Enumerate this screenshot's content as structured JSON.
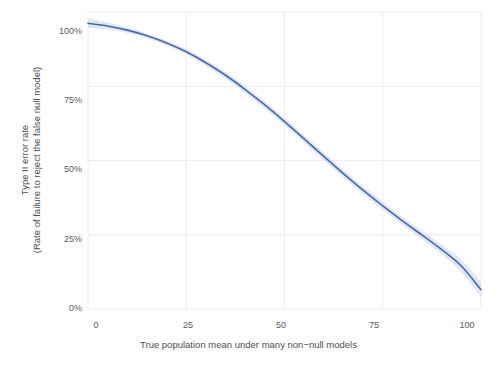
{
  "chart_data": {
    "type": "line",
    "title": "",
    "subtitle": "",
    "xlabel": "True population mean under many non−null models",
    "ylabel_line1": "Type II error rate",
    "ylabel_line2": "(Rate of failure to reject the false null model)",
    "xlim": [
      0,
      100
    ],
    "ylim": [
      0,
      1
    ],
    "grid": true,
    "legend": "none",
    "xticks": [
      0,
      25,
      50,
      75,
      100
    ],
    "xticklabels": [
      "0",
      "25",
      "50",
      "75",
      "100"
    ],
    "yticks": [
      0,
      0.25,
      0.5,
      0.75,
      1.0
    ],
    "yticklabels": [
      "0%",
      "25%",
      "50%",
      "75%",
      "100%"
    ],
    "series": [
      {
        "name": "Type II error rate",
        "color": "#4a67a8",
        "band_color": "#c5d4ef",
        "x": [
          0,
          5,
          10,
          15,
          20,
          25,
          30,
          35,
          40,
          45,
          50,
          55,
          60,
          65,
          70,
          75,
          80,
          85,
          90,
          95,
          100
        ],
        "y": [
          0.962,
          0.953,
          0.939,
          0.92,
          0.896,
          0.866,
          0.829,
          0.787,
          0.739,
          0.687,
          0.631,
          0.573,
          0.514,
          0.456,
          0.4,
          0.347,
          0.297,
          0.249,
          0.2,
          0.145,
          0.065
        ],
        "y_upper": [
          0.978,
          0.964,
          0.948,
          0.928,
          0.904,
          0.875,
          0.839,
          0.798,
          0.751,
          0.699,
          0.643,
          0.585,
          0.527,
          0.469,
          0.413,
          0.36,
          0.31,
          0.263,
          0.216,
          0.166,
          0.091
        ],
        "y_lower": [
          0.946,
          0.942,
          0.93,
          0.912,
          0.888,
          0.857,
          0.819,
          0.776,
          0.727,
          0.675,
          0.619,
          0.561,
          0.501,
          0.443,
          0.387,
          0.334,
          0.284,
          0.235,
          0.184,
          0.124,
          0.039
        ]
      }
    ]
  },
  "style": {
    "background": "#ffffff",
    "panel": "#ffffff",
    "gridline_color": "#ededed",
    "tick_text_color": "#595959",
    "axis_title_color": "#4d4d4d",
    "line_color": "#4a67a8",
    "band_color": "#c5d4ef"
  }
}
